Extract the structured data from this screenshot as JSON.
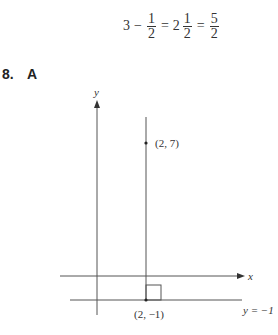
{
  "equation": {
    "lhs_whole": "3",
    "minus": "−",
    "frac1_num": "1",
    "frac1_den": "2",
    "equals1": "=",
    "mixed_whole": "2",
    "frac2_num": "1",
    "frac2_den": "2",
    "equals2": "=",
    "frac3_num": "5",
    "frac3_den": "2"
  },
  "question": {
    "number": "8.",
    "answer": "A"
  },
  "graph": {
    "y_axis_label": "y",
    "x_axis_label": "x",
    "point_top_label": "(2, 7)",
    "point_bottom_label": "(2, −1)",
    "horizontal_line_label": "y = −1",
    "line_color": "#555555"
  }
}
